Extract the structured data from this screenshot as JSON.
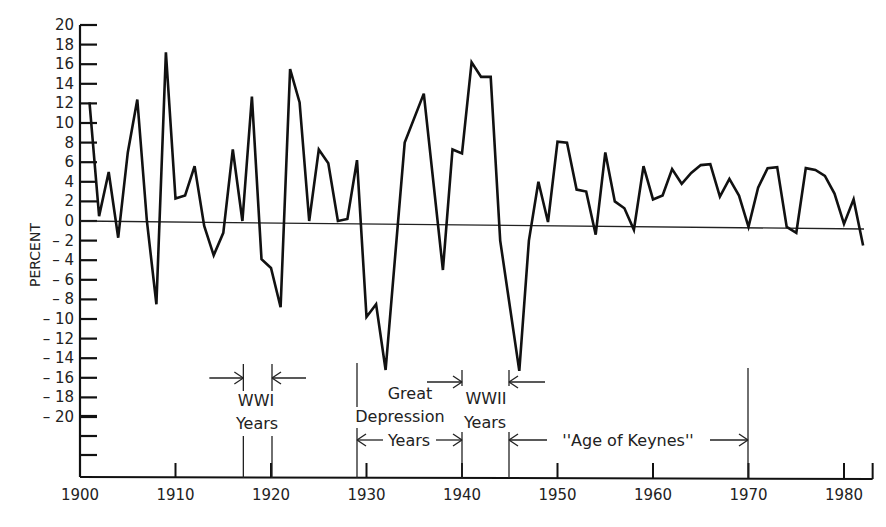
{
  "chart_data": {
    "type": "line",
    "title": "",
    "xlabel": "",
    "ylabel": "PERCENT",
    "xlim": [
      1900,
      1983
    ],
    "ylim": [
      -20,
      20
    ],
    "grid": false,
    "legend": null,
    "x_ticks": [
      1900,
      1910,
      1920,
      1930,
      1940,
      1950,
      1960,
      1970,
      1980
    ],
    "y_ticks": [
      20,
      18,
      16,
      14,
      12,
      10,
      8,
      6,
      4,
      2,
      0,
      -2,
      -4,
      -6,
      -8,
      -10,
      -12,
      -14,
      -16,
      -18,
      -20
    ],
    "y_tick_labels": [
      "20",
      "18",
      "16",
      "14",
      "12",
      "10",
      "8",
      "6",
      "4",
      "2",
      "0",
      "– 2",
      "– 4",
      "– 6",
      "– 8",
      "– 10",
      "– 12",
      "– 14",
      "– 16",
      "– 18",
      "– 20"
    ],
    "series": [
      {
        "name": "Annual percent change",
        "x": [
          1901,
          1902,
          1903,
          1904,
          1905,
          1906,
          1907,
          1908,
          1909,
          1910,
          1911,
          1912,
          1913,
          1914,
          1915,
          1916,
          1917,
          1918,
          1919,
          1920,
          1921,
          1922,
          1923,
          1924,
          1925,
          1926,
          1927,
          1928,
          1929,
          1930,
          1931,
          1932,
          1934,
          1936,
          1938,
          1939,
          1940,
          1941,
          1942,
          1943,
          1944,
          1946,
          1947,
          1948,
          1949,
          1950,
          1951,
          1952,
          1953,
          1954,
          1955,
          1956,
          1957,
          1958,
          1959,
          1960,
          1961,
          1962,
          1963,
          1964,
          1965,
          1966,
          1967,
          1968,
          1969,
          1970,
          1971,
          1972,
          1973,
          1974,
          1975,
          1976,
          1977,
          1978,
          1979,
          1980,
          1981,
          1982
        ],
        "values": [
          12.1,
          0.5,
          5.0,
          -1.7,
          7.0,
          12.4,
          0.0,
          -8.5,
          17.2,
          2.3,
          2.6,
          5.6,
          -0.5,
          -3.5,
          -1.2,
          7.3,
          0.0,
          12.7,
          -3.9,
          -4.8,
          -8.8,
          15.5,
          12.1,
          0.0,
          7.3,
          5.9,
          0.0,
          0.2,
          6.2,
          -9.8,
          -8.5,
          -15.2,
          8.0,
          13.0,
          -5.0,
          7.3,
          6.9,
          16.2,
          14.7,
          14.7,
          -2.0,
          -15.3,
          -2.0,
          4.0,
          -0.1,
          8.1,
          8.0,
          3.2,
          3.0,
          -1.4,
          7.0,
          2.0,
          1.3,
          -0.9,
          5.6,
          2.2,
          2.6,
          5.3,
          3.8,
          4.9,
          5.7,
          5.8,
          2.5,
          4.3,
          2.6,
          -0.6,
          3.4,
          5.4,
          5.5,
          -0.6,
          -1.2,
          5.4,
          5.2,
          4.6,
          2.8,
          -0.3,
          2.2,
          -2.5
        ]
      }
    ],
    "annotations": [
      {
        "label_lines": [
          "WWI",
          "Years"
        ],
        "start": 1917,
        "end": 1920,
        "style": "inward-arrows"
      },
      {
        "label_lines": [
          "Great",
          "Depression",
          "Years"
        ],
        "start": 1929,
        "end": 1940,
        "style": "span-arrows"
      },
      {
        "label_lines": [
          "WWII",
          "Years"
        ],
        "start": 1940,
        "end": 1945,
        "style": "inward-arrows"
      },
      {
        "label_lines": [
          "''Age of Keynes''"
        ],
        "start": 1945,
        "end": 1970,
        "style": "span-arrows"
      }
    ]
  },
  "labels": {
    "ylabel": "PERCENT",
    "wwi_1": "WWI",
    "wwi_2": "Years",
    "gd_1": "Great",
    "gd_2": "Depression",
    "gd_3": "Years",
    "wwii_1": "WWII",
    "wwii_2": "Years",
    "keynes": "''Age of Keynes''"
  }
}
